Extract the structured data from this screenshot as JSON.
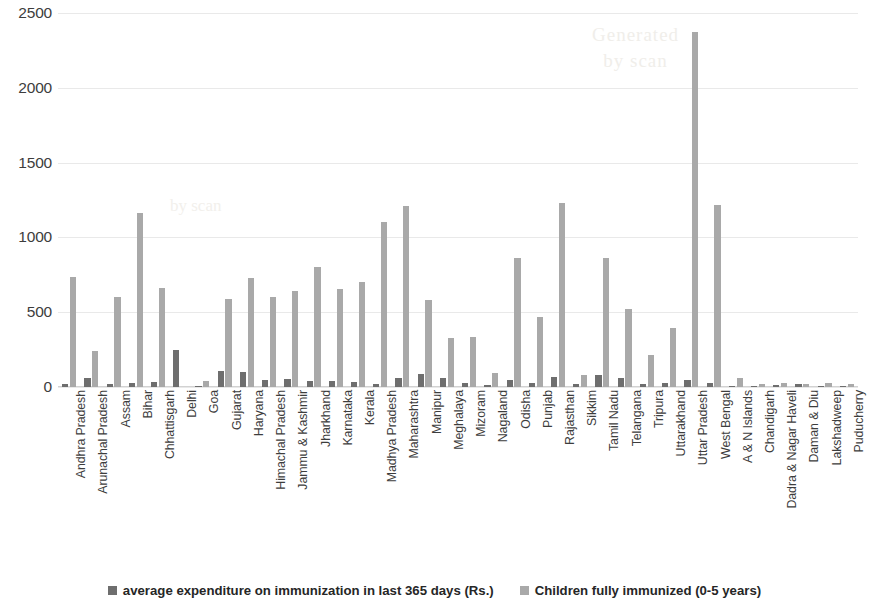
{
  "chart_data": {
    "type": "bar",
    "title": "",
    "subtitle": "",
    "xlabel": "",
    "ylabel": "",
    "ylim": [
      0,
      2500
    ],
    "yticks": [
      0,
      500,
      1000,
      1500,
      2000,
      2500
    ],
    "grid": true,
    "legend_position": "bottom",
    "categories": [
      "Andhra Pradesh",
      "Arunachal Pradesh",
      "Assam",
      "Bihar",
      "Chhattisgarh",
      "Delhi",
      "Goa",
      "Gujarat",
      "Haryana",
      "Himachal Pradesh",
      "Jammu & Kashmir",
      "Jharkhand",
      "Karnataka",
      "Kerala",
      "Madhya Pradesh",
      "Maharashtra",
      "Manipur",
      "Meghalaya",
      "Mizoram",
      "Nagaland",
      "Odisha",
      "Punjab",
      "Rajasthan",
      "Sikkim",
      "Tamil Nadu",
      "Telangana",
      "Tripura",
      "Uttarakhand",
      "Uttar Pradesh",
      "West Bengal",
      "A & N Islands",
      "Chandigarh",
      "Dadra & Nagar Haveli",
      "Daman & Diu",
      "Lakshadweep",
      "Puducherry"
    ],
    "series": [
      {
        "name": "average expenditure on immunization in last 365 days (Rs.)",
        "color": "#6e6e6e",
        "values": [
          18,
          62,
          22,
          30,
          33,
          250,
          10,
          110,
          100,
          48,
          55,
          40,
          38,
          35,
          22,
          62,
          88,
          60,
          25,
          15,
          45,
          30,
          70,
          18,
          80,
          60,
          22,
          25,
          50,
          28,
          10,
          8,
          14,
          20,
          8,
          10
        ]
      },
      {
        "name": "Children fully immunized (0-5 years)",
        "color": "#a9a9a9",
        "values": [
          735,
          240,
          600,
          1165,
          665,
          0,
          42,
          590,
          730,
          605,
          640,
          800,
          655,
          700,
          1105,
          1210,
          580,
          330,
          335,
          95,
          860,
          465,
          1230,
          80,
          865,
          520,
          215,
          395,
          2370,
          1215,
          60,
          18,
          26,
          22,
          30,
          18
        ]
      }
    ]
  },
  "legend": {
    "entries": [
      {
        "label": "average expenditure on immunization in last 365 days (Rs.)",
        "color": "#6e6e6e"
      },
      {
        "label": "Children fully immunized (0-5 years)",
        "color": "#a9a9a9"
      }
    ]
  },
  "watermark": {
    "line1": "Generated",
    "line2": "by scan"
  }
}
